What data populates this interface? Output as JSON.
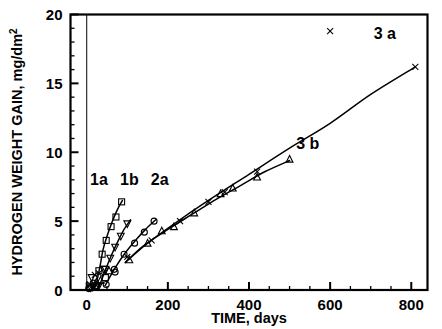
{
  "chart_data": {
    "type": "scatter",
    "title": "",
    "xlabel": "TIME, days",
    "ylabel": "HYDROGEN WEIGHT GAIN, mg/dm",
    "ylabel_superscript": "2",
    "xlim": [
      -40,
      840
    ],
    "ylim": [
      0,
      20
    ],
    "xticks": [
      0,
      200,
      400,
      600,
      800
    ],
    "yticks": [
      0,
      5,
      10,
      15,
      20
    ],
    "xtick_labels": [
      "0",
      "200",
      "400",
      "600",
      "800"
    ],
    "ytick_labels": [
      "0",
      "5",
      "10",
      "15",
      "20"
    ],
    "x_minor_step": 50,
    "y_minor_step": 1,
    "grid": false,
    "legend": "inline-annotations",
    "annotations": [
      {
        "text": "1a",
        "x": 30,
        "y": 7.6
      },
      {
        "text": "1b",
        "x": 105,
        "y": 7.6
      },
      {
        "text": "2a",
        "x": 180,
        "y": 7.6
      },
      {
        "text": "3 a",
        "x": 735,
        "y": 18.2
      },
      {
        "text": "3 b",
        "x": 545,
        "y": 10.2
      }
    ],
    "series": [
      {
        "name": "1a",
        "marker": "square",
        "curve": [
          [
            22,
            0.25
          ],
          [
            32,
            1.6
          ],
          [
            40,
            2.9
          ],
          [
            50,
            3.9
          ],
          [
            62,
            4.9
          ],
          [
            75,
            5.8
          ],
          [
            88,
            6.5
          ]
        ],
        "points": [
          [
            22,
            0.3
          ],
          [
            30,
            1.4
          ],
          [
            38,
            2.6
          ],
          [
            48,
            3.6
          ],
          [
            60,
            4.6
          ],
          [
            72,
            5.3
          ],
          [
            86,
            6.4
          ]
        ]
      },
      {
        "name": "1b",
        "marker": "triangle-down",
        "curve": [
          [
            30,
            0.2
          ],
          [
            48,
            1.6
          ],
          [
            62,
            2.6
          ],
          [
            78,
            3.6
          ],
          [
            92,
            4.4
          ],
          [
            108,
            5.1
          ]
        ],
        "points": [
          [
            30,
            0.3
          ],
          [
            46,
            1.5
          ],
          [
            58,
            2.3
          ],
          [
            70,
            3.1
          ],
          [
            84,
            3.9
          ],
          [
            100,
            4.8
          ]
        ]
      },
      {
        "name": "2a",
        "marker": "circle",
        "curve": [
          [
            45,
            0.3
          ],
          [
            70,
            1.6
          ],
          [
            95,
            2.7
          ],
          [
            120,
            3.6
          ],
          [
            145,
            4.4
          ],
          [
            170,
            5.1
          ]
        ],
        "points": [
          [
            48,
            0.4
          ],
          [
            68,
            1.5
          ],
          [
            92,
            2.6
          ],
          [
            118,
            3.4
          ],
          [
            142,
            4.2
          ],
          [
            166,
            5.0
          ]
        ]
      },
      {
        "name": "3a",
        "marker": "x",
        "curve": [
          [
            95,
            2.0
          ],
          [
            150,
            3.4
          ],
          [
            220,
            4.9
          ],
          [
            300,
            6.5
          ],
          [
            400,
            8.4
          ],
          [
            500,
            10.3
          ],
          [
            600,
            12.1
          ],
          [
            700,
            14.2
          ],
          [
            810,
            16.2
          ]
        ],
        "points": [
          [
            100,
            2.4
          ],
          [
            160,
            3.6
          ],
          [
            230,
            5.0
          ],
          [
            300,
            6.4
          ],
          [
            340,
            7.1
          ],
          [
            420,
            8.6
          ],
          [
            600,
            18.8
          ],
          [
            810,
            16.2
          ]
        ]
      },
      {
        "name": "3b",
        "marker": "triangle-up",
        "curve": [
          [
            95,
            2.0
          ],
          [
            140,
            3.2
          ],
          [
            200,
            4.4
          ],
          [
            260,
            5.5
          ],
          [
            320,
            6.6
          ],
          [
            380,
            7.6
          ],
          [
            440,
            8.6
          ],
          [
            500,
            9.4
          ]
        ],
        "points": [
          [
            105,
            2.2
          ],
          [
            150,
            3.4
          ],
          [
            185,
            4.3
          ],
          [
            215,
            4.6
          ],
          [
            265,
            5.6
          ],
          [
            330,
            7.0
          ],
          [
            360,
            7.4
          ],
          [
            420,
            8.2
          ],
          [
            500,
            9.5
          ]
        ]
      },
      {
        "name": "origin-cluster",
        "marker": "mixed",
        "curve": [],
        "points": [
          [
            5,
            0.1
          ],
          [
            10,
            0.15
          ],
          [
            14,
            0.2
          ],
          [
            18,
            0.25
          ],
          [
            22,
            0.3
          ],
          [
            8,
            0.4
          ],
          [
            16,
            0.5
          ],
          [
            24,
            0.6
          ],
          [
            12,
            0.9
          ],
          [
            20,
            1.1
          ],
          [
            30,
            1.2
          ],
          [
            42,
            1.5
          ],
          [
            55,
            1.4
          ],
          [
            70,
            1.3
          ],
          [
            34,
            0.7
          ],
          [
            46,
            0.9
          ]
        ]
      }
    ]
  }
}
